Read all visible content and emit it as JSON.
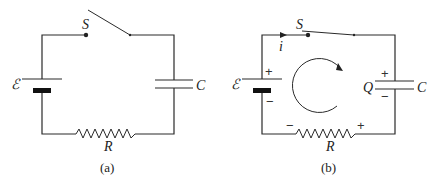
{
  "diagrams": [
    {
      "id": "a",
      "caption": "(a)",
      "labels": {
        "switch": "S",
        "emf": "ℰ",
        "capacitor": "C",
        "resistor": "R"
      },
      "switch_state": "open"
    },
    {
      "id": "b",
      "caption": "(b)",
      "labels": {
        "switch": "S",
        "emf": "ℰ",
        "capacitor": "C",
        "charge": "Q",
        "resistor": "R",
        "current": "i"
      },
      "switch_state": "closed",
      "polarity": {
        "battery_top": "+",
        "battery_bottom": "−",
        "capacitor_top": "+",
        "capacitor_bottom": "−",
        "resistor_left": "−",
        "resistor_right": "+"
      },
      "loop_direction": "clockwise"
    }
  ]
}
